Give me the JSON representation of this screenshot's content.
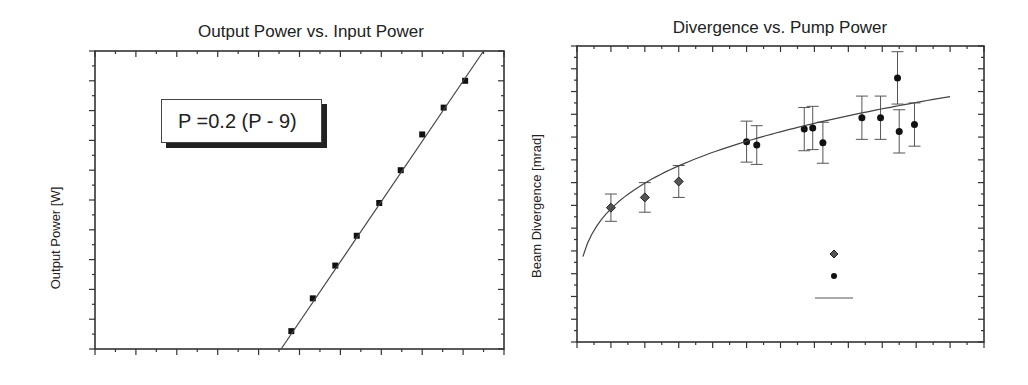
{
  "chart_data": [
    {
      "type": "scatter",
      "title": "Output Power vs. Input Power",
      "xlabel": "",
      "ylabel": "Output Power [W]",
      "annotation": "P   =0.2 (P   - 9)",
      "frame_px": {
        "x0": 95,
        "y0": 51,
        "x1": 504,
        "y1": 349
      },
      "xlim": [
        0,
        40
      ],
      "ylim": [
        0,
        10
      ],
      "x_major_ticks": 10,
      "y_major_ticks": 10,
      "grid": false,
      "series": [
        {
          "name": "measured",
          "marker": "square",
          "x": [
            19.2,
            21.3,
            23.5,
            25.6,
            27.8,
            29.9,
            32.0,
            34.1,
            36.2
          ],
          "y": [
            0.6,
            1.7,
            2.8,
            3.8,
            4.9,
            6.0,
            7.2,
            8.1,
            9.0
          ]
        },
        {
          "name": "fit",
          "marker": "line",
          "x": [
            18.2,
            38.0
          ],
          "y": [
            0.0,
            10.0
          ]
        }
      ]
    },
    {
      "type": "scatter",
      "title": "Divergence vs. Pump Power",
      "xlabel": "",
      "ylabel": "Beam Divergence [mrad]",
      "frame_px": {
        "x0": 577,
        "y0": 46,
        "x1": 984,
        "y1": 342
      },
      "xlim": [
        0,
        24
      ],
      "ylim": [
        0,
        13
      ],
      "x_major_ticks": 12,
      "y_major_ticks": 13,
      "grid": false,
      "series": [
        {
          "name": "diamond-series",
          "marker": "diamond",
          "x": [
            2.0,
            4.0,
            6.0
          ],
          "y": [
            5.9,
            6.35,
            7.05
          ],
          "err": [
            0.6,
            0.65,
            0.7
          ]
        },
        {
          "name": "circle-series",
          "marker": "circle",
          "x": [
            10.0,
            10.6,
            13.4,
            13.9,
            14.5,
            16.8,
            17.9,
            18.9,
            19.0,
            19.9
          ],
          "y": [
            8.8,
            8.65,
            9.35,
            9.4,
            8.75,
            9.85,
            9.85,
            11.6,
            9.25,
            9.55
          ],
          "err": [
            0.9,
            0.85,
            0.95,
            0.95,
            0.9,
            0.95,
            0.95,
            1.15,
            0.95,
            0.95
          ]
        },
        {
          "name": "fit",
          "marker": "line",
          "curve": "power",
          "x_range": [
            0.35,
            22.0
          ]
        }
      ],
      "legend": {
        "entries": [
          {
            "marker": "diamond",
            "label": ""
          },
          {
            "marker": "circle",
            "label": ""
          },
          {
            "marker": "line",
            "label": ""
          }
        ],
        "position": "lower-right"
      }
    }
  ]
}
